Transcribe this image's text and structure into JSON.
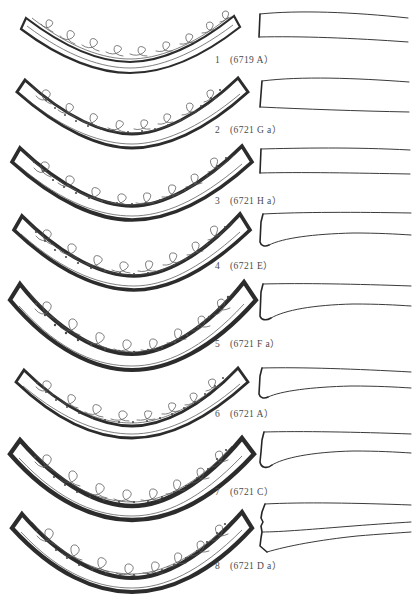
{
  "plate": {
    "title": "Archaeological line-drawing plate of eight arc-shaped decorated ornaments with profile sections",
    "figure_count": 8,
    "background_color": "#ffffff",
    "ink_color": "#2c2c2c",
    "caption_color": "#4a4a4a"
  },
  "figures": [
    {
      "index": "1",
      "catalog": "(6719A)",
      "caption": "1 (6719 A）",
      "number": "1",
      "registration": "6719A",
      "arc_depth": "shallow",
      "rim_weight": "thin",
      "decor": "scroll-volute band with plain border",
      "dot_border": false,
      "profile_type": "straight-tapering-bar"
    },
    {
      "index": "2",
      "catalog": "(6721Ga)",
      "caption": "2 (6721 G a）",
      "number": "2",
      "registration": "6721Ga",
      "arc_depth": "shallow",
      "rim_weight": "medium",
      "decor": "scroll-volute band with beaded border",
      "dot_border": true,
      "profile_type": "straight-tapering-bar"
    },
    {
      "index": "3",
      "catalog": "(6721Ha)",
      "caption": "3 (6721 H a）",
      "number": "3",
      "registration": "6721Ha",
      "arc_depth": "medium",
      "rim_weight": "heavy",
      "decor": "scroll-volute band with beaded border",
      "dot_border": true,
      "profile_type": "straight-tapering-bar"
    },
    {
      "index": "4",
      "catalog": "(6721E)",
      "caption": "4 (6721 E）",
      "number": "4",
      "registration": "6721E",
      "arc_depth": "medium",
      "rim_weight": "heavy",
      "decor": "scroll-volute band with beaded border",
      "dot_border": true,
      "profile_type": "hooked-flared-end"
    },
    {
      "index": "5",
      "catalog": "(6721Fa)",
      "caption": "5 (6721 F a）",
      "number": "5",
      "registration": "6721Fa",
      "arc_depth": "deep",
      "rim_weight": "heavy",
      "decor": "scroll-volute band with beaded border",
      "dot_border": true,
      "profile_type": "hooked-flared-end"
    },
    {
      "index": "6",
      "catalog": "(6721A)",
      "caption": "6 (6721 A）",
      "number": "6",
      "registration": "6721A",
      "arc_depth": "medium",
      "rim_weight": "medium",
      "decor": "scroll-volute band with beaded border",
      "dot_border": true,
      "profile_type": "hooked-flared-end"
    },
    {
      "index": "7",
      "catalog": "(6721C)",
      "caption": "7 (6721 C）",
      "number": "7",
      "registration": "6721C",
      "arc_depth": "deep",
      "rim_weight": "heavy",
      "decor": "scroll-volute band with beaded border",
      "dot_border": true,
      "profile_type": "hooked-notched-end"
    },
    {
      "index": "8",
      "catalog": "(6721Da)",
      "caption": "8 (6721 D a）",
      "number": "8",
      "registration": "6721Da",
      "arc_depth": "deep",
      "rim_weight": "heavy",
      "decor": "scroll-volute band with beaded border",
      "dot_border": true,
      "profile_type": "notched-tapering-bar"
    }
  ]
}
